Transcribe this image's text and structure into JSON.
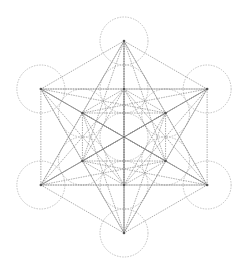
{
  "figure": {
    "name": "Metatron's Cube",
    "center": [
      124,
      137
    ],
    "outer_radius": 96,
    "circle_radius": 24,
    "line_color": "#8a8a8a",
    "circle_color": "#a8a8a8",
    "node_color": "#555555",
    "background": "#ffffff"
  }
}
